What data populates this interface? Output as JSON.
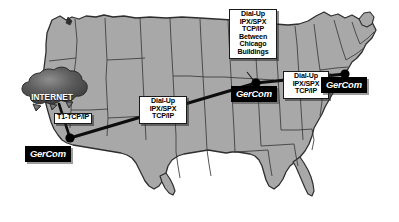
{
  "diagram": {
    "map_region": "United States",
    "colors": {
      "land_fill": "#a8a8a8",
      "state_border": "#303030",
      "link_line": "#101010",
      "node_dot": "#000000",
      "callout_background": "#ffffff",
      "plate_background": "#000000",
      "plate_text": "#ffffff",
      "cloud_fill": "#555555",
      "page_background": "#ffffff"
    }
  },
  "cloud": {
    "label": "INTERNET",
    "icon": "cloud-icon"
  },
  "sites": [
    {
      "id": "southwest",
      "label": "GerCom",
      "node_icon": "network-node-icon"
    },
    {
      "id": "chicago",
      "label": "GerCom",
      "node_icon": "network-node-icon"
    },
    {
      "id": "east",
      "label": "GerCom",
      "node_icon": "network-node-icon"
    }
  ],
  "callouts": {
    "t1": {
      "lines": [
        "T1-TCP/IP"
      ]
    },
    "center_link": {
      "lines": [
        "Dial-Up",
        "IPX/SPX",
        "TCP/IP"
      ]
    },
    "chicago_buildings": {
      "lines": [
        "Dial-Up",
        "IPX/SPX",
        "TCP/IP",
        "Between",
        "Chicago",
        "Buildings"
      ]
    },
    "east_link": {
      "lines": [
        "Dial-Up",
        "IPX/SPX",
        "TCP/IP"
      ]
    }
  },
  "links": [
    {
      "id": "cloud-to-southwest",
      "from": "internet-cloud",
      "to": "southwest",
      "label": "T1-TCP/IP"
    },
    {
      "id": "southwest-to-chicago",
      "from": "southwest",
      "to": "chicago",
      "label": "Dial-Up IPX/SPX TCP/IP"
    },
    {
      "id": "chicago-to-east",
      "from": "chicago",
      "to": "east",
      "label": "Dial-Up IPX/SPX TCP/IP"
    }
  ]
}
